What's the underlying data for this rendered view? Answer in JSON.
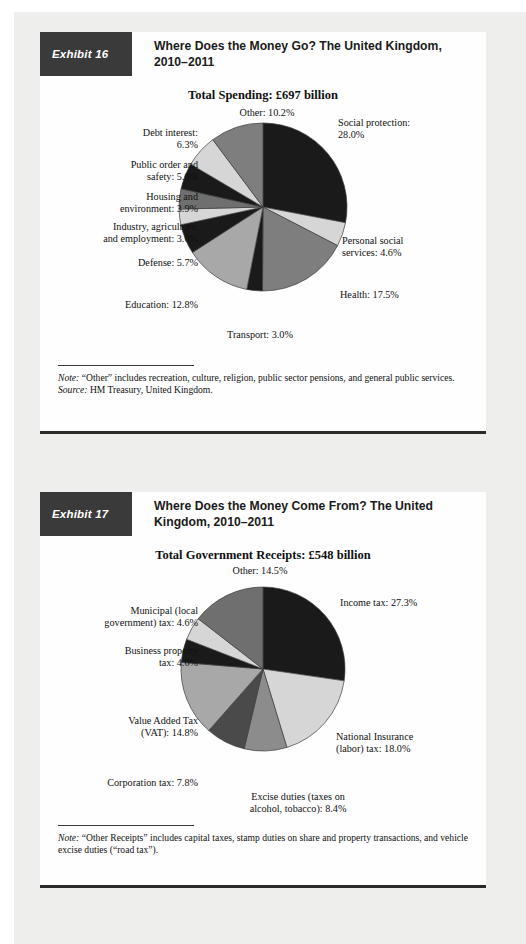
{
  "page": {
    "background_color": "#eeeeec",
    "card_color": "#fefefe",
    "tag_color": "#3a3a3a"
  },
  "palette": {
    "dark": "#1a1a1a",
    "mid": "#7e7e7e",
    "light": "#d6d6d6",
    "outline": "#4a4a4a"
  },
  "exhibits": [
    {
      "tag": "Exhibit 16",
      "title": "Where Does the Money Go? The United Kingdom, 2010–2011",
      "chart_title": "Total Spending: £697 billion",
      "note_label": "Note:",
      "note_text": " “Other” includes recreation, culture, religion, public sector pensions, and general public services.",
      "source_label": "Source:",
      "source_text": " HM Treasury, United Kingdom.",
      "chart_data": {
        "type": "pie",
        "title": "Total Spending: £697 billion",
        "unit": "percent",
        "total": "£697 billion",
        "start_angle_deg": 0,
        "direction": "clockwise",
        "legend": "none (direct labels)",
        "slices": [
          {
            "label": "Social protection: 28.0%",
            "name": "Social protection",
            "value": 28.0,
            "color": "#1a1a1a"
          },
          {
            "label": "Personal social services: 4.6%",
            "name": "Personal social services",
            "value": 4.6,
            "color": "#d6d6d6"
          },
          {
            "label": "Health: 17.5%",
            "name": "Health",
            "value": 17.5,
            "color": "#7e7e7e"
          },
          {
            "label": "Transport: 3.0%",
            "name": "Transport",
            "value": 3.0,
            "color": "#1a1a1a"
          },
          {
            "label": "Education: 12.8%",
            "name": "Education",
            "value": 12.8,
            "color": "#a8a8a8"
          },
          {
            "label": "Defense: 5.7%",
            "name": "Defense",
            "value": 5.7,
            "color": "#1a1a1a"
          },
          {
            "label": "Industry, agriculture, and employment: 3.0%",
            "name": "Industry, agriculture, and employment",
            "value": 3.0,
            "color": "#d6d6d6"
          },
          {
            "label": "Housing and environment: 3.9%",
            "name": "Housing and environment",
            "value": 3.9,
            "color": "#6f6f6f"
          },
          {
            "label": "Public order and safety: 5.0%",
            "name": "Public order and safety",
            "value": 5.0,
            "color": "#1a1a1a"
          },
          {
            "label": "Debt interest: 6.3%",
            "name": "Debt interest",
            "value": 6.3,
            "color": "#d6d6d6"
          },
          {
            "label": "Other: 10.2%",
            "name": "Other",
            "value": 10.2,
            "color": "#7e7e7e"
          }
        ]
      },
      "labels": [
        {
          "text": "Other: 10.2%",
          "align": "c",
          "x": 172,
          "y": 4,
          "w": 110
        },
        {
          "text": "Debt interest:\n6.3%",
          "align": "r",
          "x": 50,
          "y": 24,
          "w": 108
        },
        {
          "text": "Public order and\nsafety: 5.0%",
          "align": "r",
          "x": 30,
          "y": 56,
          "w": 128
        },
        {
          "text": "Housing and\nenvironment: 3.9%",
          "align": "r",
          "x": 18,
          "y": 88,
          "w": 140
        },
        {
          "text": "Industry, agriculture,\nand employment: 3.0%",
          "align": "r",
          "x": 6,
          "y": 118,
          "w": 152
        },
        {
          "text": "Defense: 5.7%",
          "align": "r",
          "x": 46,
          "y": 154,
          "w": 112
        },
        {
          "text": "Education: 12.8%",
          "align": "r",
          "x": 40,
          "y": 196,
          "w": 118
        },
        {
          "text": "Transport: 3.0%",
          "align": "c",
          "x": 160,
          "y": 226,
          "w": 120
        },
        {
          "text": "Social protection:\n28.0%",
          "align": "l",
          "x": 298,
          "y": 14,
          "w": 132
        },
        {
          "text": "Personal social\nservices: 4.6%",
          "align": "l",
          "x": 302,
          "y": 132,
          "w": 132
        },
        {
          "text": "Health: 17.5%",
          "align": "l",
          "x": 300,
          "y": 186,
          "w": 120
        }
      ]
    },
    {
      "tag": "Exhibit 17",
      "title": "Where Does the Money Come From? The United Kingdom, 2010–2011",
      "chart_title": "Total Government Receipts: £548 billion",
      "note_label": "Note:",
      "note_text": " “Other Receipts” includes capital taxes, stamp duties on share and property transactions, and vehicle excise duties (“road tax”).",
      "source_label": "",
      "source_text": "",
      "chart_data": {
        "type": "pie",
        "title": "Total Government Receipts: £548 billion",
        "unit": "percent",
        "total": "£548 billion",
        "start_angle_deg": 0,
        "direction": "clockwise",
        "legend": "none (direct labels)",
        "slices": [
          {
            "label": "Income tax: 27.3%",
            "name": "Income tax",
            "value": 27.3,
            "color": "#1a1a1a"
          },
          {
            "label": "National Insurance (labor) tax: 18.0%",
            "name": "National Insurance (labor) tax",
            "value": 18.0,
            "color": "#d6d6d6"
          },
          {
            "label": "Excise duties (taxes on alcohol, tobacco): 8.4%",
            "name": "Excise duties (taxes on alcohol, tobacco)",
            "value": 8.4,
            "color": "#8c8c8c"
          },
          {
            "label": "Corporation tax: 7.8%",
            "name": "Corporation tax",
            "value": 7.8,
            "color": "#4a4a4a"
          },
          {
            "label": "Value Added Tax (VAT): 14.8%",
            "name": "Value Added Tax (VAT)",
            "value": 14.8,
            "color": "#a8a8a8"
          },
          {
            "label": "Business property tax: 4.6%",
            "name": "Business property tax",
            "value": 4.6,
            "color": "#1a1a1a"
          },
          {
            "label": "Municipal (local government) tax: 4.6%",
            "name": "Municipal (local government) tax",
            "value": 4.6,
            "color": "#d6d6d6"
          },
          {
            "label": "Other: 14.5%",
            "name": "Other",
            "value": 14.5,
            "color": "#6f6f6f"
          }
        ]
      },
      "labels": [
        {
          "text": "Other: 14.5%",
          "align": "c",
          "x": 160,
          "y": 2,
          "w": 120
        },
        {
          "text": "Municipal (local\ngovernment) tax: 4.6%",
          "align": "r",
          "x": 6,
          "y": 42,
          "w": 152
        },
        {
          "text": "Business property\ntax: 4.6%",
          "align": "r",
          "x": 30,
          "y": 82,
          "w": 128
        },
        {
          "text": "Value Added Tax\n(VAT): 14.8%",
          "align": "r",
          "x": 34,
          "y": 152,
          "w": 124
        },
        {
          "text": "Corporation tax: 7.8%",
          "align": "r",
          "x": 24,
          "y": 214,
          "w": 134
        },
        {
          "text": "Income tax: 27.3%",
          "align": "l",
          "x": 300,
          "y": 34,
          "w": 130
        },
        {
          "text": "National Insurance\n(labor) tax: 18.0%",
          "align": "l",
          "x": 296,
          "y": 168,
          "w": 132
        },
        {
          "text": "Excise duties (taxes on\nalcohol, tobacco): 8.4%",
          "align": "c",
          "x": 178,
          "y": 228,
          "w": 160
        }
      ]
    }
  ]
}
